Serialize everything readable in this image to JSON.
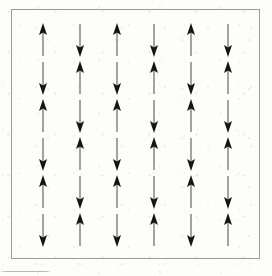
{
  "figure": {
    "frame": {
      "border_color": "#9a9a98",
      "background_color": "#fdfdfc"
    },
    "lattice": {
      "rows": 6,
      "columns": 6,
      "arrow_shaft_color": "#6e6e6e",
      "arrow_head_color": "#151515",
      "pattern_name": "checkerboard-alternating",
      "grid": [
        [
          "up",
          "down",
          "up",
          "down",
          "up",
          "down"
        ],
        [
          "down",
          "up",
          "down",
          "up",
          "down",
          "up"
        ],
        [
          "up",
          "down",
          "up",
          "down",
          "up",
          "down"
        ],
        [
          "down",
          "up",
          "down",
          "up",
          "down",
          "up"
        ],
        [
          "up",
          "down",
          "up",
          "down",
          "up",
          "down"
        ],
        [
          "down",
          "up",
          "down",
          "up",
          "down",
          "up"
        ]
      ]
    }
  },
  "caption": {
    "text": "̲ ̲  ̲̲̲  ̲ ̲̲  ̲̲ ̲  ̲̲̲̲  ̲̲ ̲  ̲̲̲  ̲ ̲̲  ̲̲̲̲  ̲̲ ̲"
  },
  "chart_data": {
    "type": "heatmap",
    "xlabel": "",
    "ylabel": "",
    "categories": [
      "c1",
      "c2",
      "c3",
      "c4",
      "c5",
      "c6"
    ],
    "x": [
      1,
      2,
      3,
      4,
      5,
      6
    ],
    "series": [
      {
        "name": "row 1",
        "values": [
          1,
          -1,
          1,
          -1,
          1,
          -1
        ]
      },
      {
        "name": "row 2",
        "values": [
          -1,
          1,
          -1,
          1,
          -1,
          1
        ]
      },
      {
        "name": "row 3",
        "values": [
          1,
          -1,
          1,
          -1,
          1,
          -1
        ]
      },
      {
        "name": "row 4",
        "values": [
          -1,
          1,
          -1,
          1,
          -1,
          1
        ]
      },
      {
        "name": "row 5",
        "values": [
          1,
          -1,
          1,
          -1,
          1,
          -1
        ]
      },
      {
        "name": "row 6",
        "values": [
          -1,
          1,
          -1,
          1,
          -1,
          1
        ]
      }
    ],
    "value_legend": {
      "1": "up",
      "-1": "down"
    },
    "grid": false,
    "legend_position": "none"
  }
}
